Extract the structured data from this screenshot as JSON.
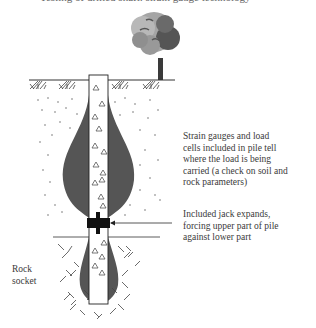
{
  "top_caption_cut": "Testing of drilled shaft: strain gauge technology",
  "labels": {
    "strain_gauges": "Strain gauges and load\ncells included in pile tell\nwhere the load is being\ncarried (a check on soil and\nrock parameters)",
    "jack": "Included jack expands,\nforcing upper part of pile\nagainst lower part",
    "rock_socket": "Rock\nsocket"
  },
  "colors": {
    "bulb_fill": "#555555",
    "pile_fill": "#ffffff",
    "line": "#333333",
    "jack": "#111111",
    "tree_light": "#a8a8a8",
    "tree_dark": "#4a4a4a"
  },
  "elements": {
    "pile_triangles_count": 16,
    "ground_surface": true,
    "tree": true,
    "jack_arrow": true
  }
}
